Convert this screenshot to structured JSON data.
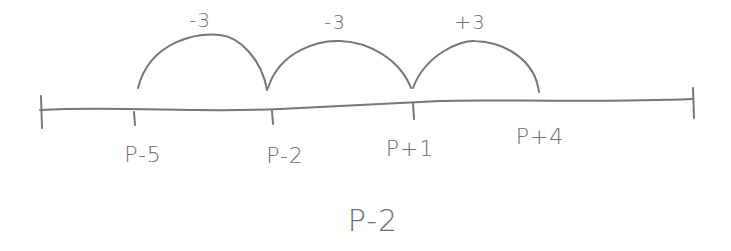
{
  "diagram": {
    "type": "number-line",
    "stroke_color": "#777777",
    "ticks": [
      {
        "label": "P-5",
        "x": 135
      },
      {
        "label": "P-2",
        "x": 272
      },
      {
        "label": "P+1",
        "x": 413
      },
      {
        "label": "P+4",
        "x": 540
      }
    ],
    "jumps": [
      {
        "label": "-3",
        "from": "P-5",
        "to": "P-2"
      },
      {
        "label": "-3",
        "from": "P-2",
        "to": "P+1"
      },
      {
        "label": "+3",
        "from": "P+1",
        "to": "P+4"
      }
    ],
    "answer": "P-2"
  }
}
